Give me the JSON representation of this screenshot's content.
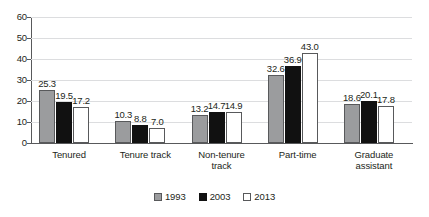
{
  "chart_data": {
    "type": "bar",
    "title": "",
    "subtitle": "",
    "xlabel": "",
    "ylabel": "",
    "ylim": [
      0,
      60
    ],
    "ytick_values": [
      0,
      10,
      20,
      30,
      40,
      50,
      60
    ],
    "ytick_labels": [
      "0",
      "10",
      "20",
      "30",
      "40",
      "50",
      "60"
    ],
    "grid": true,
    "legend_position": "bottom-center",
    "categories": [
      "Tenured",
      "Tenure track",
      "Non-tenure track",
      "Part-time",
      "Graduate assistant"
    ],
    "category_lines": [
      [
        "Tenured"
      ],
      [
        "Tenure track"
      ],
      [
        "Non-tenure",
        "track"
      ],
      [
        "Part-time"
      ],
      [
        "Graduate",
        "assistant"
      ]
    ],
    "series": [
      {
        "name": "1993",
        "color": "#9b9c9e",
        "values": [
          25.3,
          10.3,
          13.2,
          32.6,
          18.6
        ],
        "labels": [
          "25.3",
          "10.3",
          "13.2",
          "32.6",
          "18.6"
        ]
      },
      {
        "name": "2003",
        "color": "#111111",
        "values": [
          19.5,
          8.8,
          14.7,
          36.9,
          20.1
        ],
        "labels": [
          "19.5",
          "8.8",
          "14.7",
          "36.9",
          "20.1"
        ]
      },
      {
        "name": "2013",
        "color": "#ffffff",
        "values": [
          17.2,
          7.0,
          14.9,
          43.0,
          17.8
        ],
        "labels": [
          "17.2",
          "7.0",
          "14.9",
          "43.0",
          "17.8"
        ]
      }
    ]
  },
  "legend": {
    "items": [
      {
        "label": "1993",
        "swatch": "swatch-gray"
      },
      {
        "label": "2003",
        "swatch": "swatch-black"
      },
      {
        "label": "2013",
        "swatch": "swatch-white"
      }
    ]
  }
}
